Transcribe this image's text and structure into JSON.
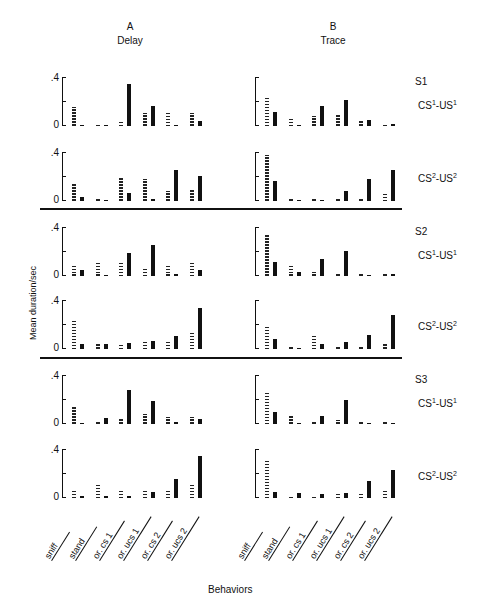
{
  "columns": [
    {
      "letter": "A",
      "name": "Delay"
    },
    {
      "letter": "B",
      "name": "Trace"
    }
  ],
  "y_axis_label": "Mean duration/sec",
  "x_axis_label": "Behaviors",
  "tick_labels": {
    "top": ".4",
    "bottom": "0"
  },
  "behaviors": [
    "sniff",
    "stand",
    "or. cs 1",
    "or. ucs 1",
    "or. cs 2",
    "or. ucs 2"
  ],
  "subjects": [
    {
      "label": "S1",
      "conditions": [
        {
          "cs": "1",
          "us": "1"
        },
        {
          "cs": "2",
          "us": "2"
        }
      ]
    },
    {
      "label": "S2",
      "conditions": [
        {
          "cs": "1",
          "us": "1"
        },
        {
          "cs": "2",
          "us": "2"
        }
      ]
    },
    {
      "label": "S3",
      "conditions": [
        {
          "cs": "1",
          "us": "1"
        },
        {
          "cs": "2",
          "us": "2"
        }
      ]
    }
  ],
  "chart_data": {
    "type": "bar",
    "xlabel": "Behaviors",
    "ylabel": "Mean duration/sec",
    "ylim": [
      0,
      0.4
    ],
    "yticks": [
      0,
      0.2,
      0.4
    ],
    "categories": [
      "sniff",
      "stand",
      "or. cs 1",
      "or. ucs 1",
      "or. cs 2",
      "or. ucs 2"
    ],
    "legend": {
      "dotted": "CS period",
      "solid": "UCS period"
    },
    "panels": [
      {
        "column": "A Delay",
        "subject": "S1",
        "condition": "CS1-US1",
        "series": [
          {
            "name": "dotted",
            "values": [
              0.16,
              0.01,
              0.04,
              0.11,
              0.12,
              0.11
            ]
          },
          {
            "name": "solid",
            "values": [
              0.01,
              0.01,
              0.35,
              0.17,
              0.005,
              0.04
            ]
          }
        ]
      },
      {
        "column": "B Trace",
        "subject": "S1",
        "condition": "CS1-US1",
        "series": [
          {
            "name": "dotted",
            "values": [
              0.24,
              0.07,
              0.08,
              0.1,
              0.05,
              0.01
            ]
          },
          {
            "name": "solid",
            "values": [
              0.12,
              0.005,
              0.17,
              0.22,
              0.05,
              0.02
            ]
          }
        ]
      },
      {
        "column": "A Delay",
        "subject": "S1",
        "condition": "CS2-US2",
        "series": [
          {
            "name": "dotted",
            "values": [
              0.14,
              0.01,
              0.2,
              0.18,
              0.08,
              0.1
            ]
          },
          {
            "name": "solid",
            "values": [
              0.03,
              0.01,
              0.07,
              0.02,
              0.26,
              0.21
            ]
          }
        ]
      },
      {
        "column": "B Trace",
        "subject": "S1",
        "condition": "CS2-US2",
        "series": [
          {
            "name": "dotted",
            "values": [
              0.38,
              0.02,
              0.01,
              0.02,
              0.01,
              0.06
            ]
          },
          {
            "name": "solid",
            "values": [
              0.17,
              0.01,
              0.01,
              0.08,
              0.18,
              0.26
            ]
          }
        ]
      },
      {
        "column": "A Delay",
        "subject": "S2",
        "condition": "CS1-US1",
        "series": [
          {
            "name": "dotted",
            "values": [
              0.08,
              0.11,
              0.12,
              0.07,
              0.08,
              0.12
            ]
          },
          {
            "name": "solid",
            "values": [
              0.05,
              0.005,
              0.19,
              0.26,
              0.02,
              0.05
            ]
          }
        ]
      },
      {
        "column": "B Trace",
        "subject": "S2",
        "condition": "CS1-US1",
        "series": [
          {
            "name": "dotted",
            "values": [
              0.35,
              0.08,
              0.03,
              0.02,
              0.005,
              0.005
            ]
          },
          {
            "name": "solid",
            "values": [
              0.12,
              0.03,
              0.14,
              0.21,
              0.01,
              0.02
            ]
          }
        ]
      },
      {
        "column": "A Delay",
        "subject": "S2",
        "condition": "CS2-US2",
        "series": [
          {
            "name": "dotted",
            "values": [
              0.25,
              0.04,
              0.05,
              0.06,
              0.06,
              0.13
            ]
          },
          {
            "name": "solid",
            "values": [
              0.04,
              0.04,
              0.05,
              0.07,
              0.11,
              0.34
            ]
          }
        ]
      },
      {
        "column": "B Trace",
        "subject": "S2",
        "condition": "CS2-US2",
        "series": [
          {
            "name": "dotted",
            "values": [
              0.19,
              0.005,
              0.11,
              0.02,
              0.005,
              0.04
            ]
          },
          {
            "name": "solid",
            "values": [
              0.08,
              0.005,
              0.04,
              0.06,
              0.12,
              0.28
            ]
          }
        ]
      },
      {
        "column": "A Delay",
        "subject": "S3",
        "condition": "CS1-US1",
        "series": [
          {
            "name": "dotted",
            "values": [
              0.14,
              0.005,
              0.04,
              0.08,
              0.06,
              0.06
            ]
          },
          {
            "name": "solid",
            "values": [
              0.005,
              0.05,
              0.28,
              0.19,
              0.02,
              0.04
            ]
          }
        ]
      },
      {
        "column": "B Trace",
        "subject": "S3",
        "condition": "CS1-US1",
        "series": [
          {
            "name": "dotted",
            "values": [
              0.26,
              0.07,
              0.01,
              0.03,
              0.01,
              0.01
            ]
          },
          {
            "name": "solid",
            "values": [
              0.1,
              0.01,
              0.07,
              0.2,
              0.01,
              0.01
            ]
          }
        ]
      },
      {
        "column": "A Delay",
        "subject": "S3",
        "condition": "CS2-US2",
        "series": [
          {
            "name": "dotted",
            "values": [
              0.06,
              0.12,
              0.06,
              0.07,
              0.07,
              0.12
            ]
          },
          {
            "name": "solid",
            "values": [
              0.02,
              0.02,
              0.02,
              0.05,
              0.16,
              0.35
            ]
          }
        ]
      },
      {
        "column": "B Trace",
        "subject": "S3",
        "condition": "CS2-US2",
        "series": [
          {
            "name": "dotted",
            "values": [
              0.32,
              0.005,
              0.005,
              0.05,
              0.04,
              0.06
            ]
          },
          {
            "name": "solid",
            "values": [
              0.05,
              0.04,
              0.03,
              0.04,
              0.14,
              0.23
            ]
          }
        ]
      }
    ]
  }
}
